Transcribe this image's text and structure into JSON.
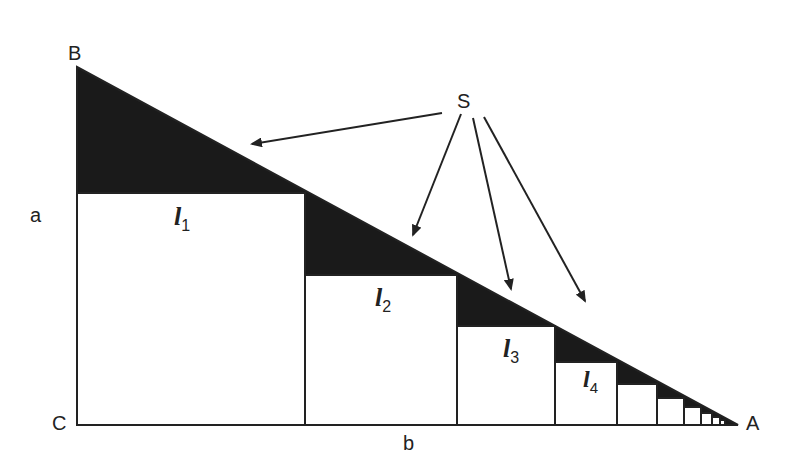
{
  "diagram": {
    "vertices": {
      "B": "B",
      "C": "C",
      "A": "A"
    },
    "sides": {
      "a": "a",
      "b": "b"
    },
    "shaded_label": "S",
    "squares": [
      {
        "label": "l",
        "index": "1"
      },
      {
        "label": "l",
        "index": "2"
      },
      {
        "label": "l",
        "index": "3"
      },
      {
        "label": "l",
        "index": "4"
      }
    ],
    "colors": {
      "shade": "#1a1a1a",
      "line": "#222222",
      "background": "#ffffff"
    }
  }
}
